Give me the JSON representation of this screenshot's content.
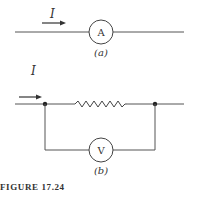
{
  "figure": {
    "caption": "FIGURE 17.24",
    "panel_a": {
      "label": "(a)",
      "current_label": "I",
      "meter_label": "A",
      "meter_type": "ammeter"
    },
    "panel_b": {
      "label": "(b)",
      "current_label": "I",
      "meter_label": "V",
      "meter_type": "voltmeter",
      "component": "resistor"
    },
    "colors": {
      "line": "#333333",
      "background": "#ffffff"
    }
  }
}
